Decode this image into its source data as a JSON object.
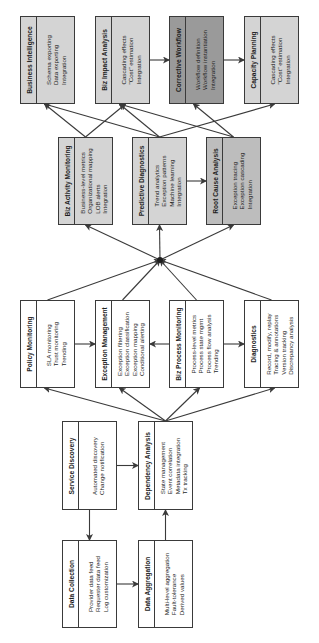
{
  "diagram": {
    "orientation": "rotated-90-ccw",
    "colors": {
      "line": "#3a3a3a",
      "box_light": "#d4d4d4",
      "box_mid": "#bdbdbd",
      "box_dark": "#9a9a9a",
      "box_white": "#ffffff"
    },
    "boxes": {
      "business_intelligence": {
        "title": "Business Intelligence",
        "items": [
          "Schema exporting",
          "Data exporting",
          "Integration"
        ]
      },
      "biz_impact_analysis": {
        "title": "Biz Impact Analysis",
        "items": [
          "Cascading effects",
          "\"Cost\" estimation",
          "Integration"
        ]
      },
      "corrective_workflow": {
        "title": "Corrective Workflow",
        "items": [
          "Workflow definition",
          "Workflow instantiation",
          "Integration"
        ]
      },
      "capacity_planning": {
        "title": "Capacity Planning",
        "items": [
          "Cascading effects",
          "\"Cost\" estimation",
          "Integration"
        ]
      },
      "biz_activity_monitoring": {
        "title": "Biz Activity Monitoring",
        "items": [
          "Business-level metrics",
          "Organizational mapping",
          "LOB alerts",
          "Integration"
        ]
      },
      "predictive_diagnostics": {
        "title": "Predictive Diagnostics",
        "items": [
          "Trend analytics",
          "Exception patterns",
          "Machine learning",
          "Integration"
        ]
      },
      "root_cause_analysis": {
        "title": "Root Cause Analysis",
        "items": [
          "Exception tracing",
          "Exception cascading",
          "Integration"
        ]
      },
      "policy_monitoring": {
        "title": "Policy Monitoring",
        "items": [
          "SLA monitoring",
          "Trust monitoring",
          "Trending"
        ]
      },
      "exception_management": {
        "title": "Exception Management",
        "items": [
          "Exception filtering",
          "Exception classification",
          "Exception mapping",
          "Conditional alerting"
        ]
      },
      "biz_process_monitoring": {
        "title": "Biz Process Monitoring",
        "items": [
          "Process-level metrics",
          "Process state mgmt",
          "Process flow analysis",
          "Trending"
        ]
      },
      "diagnostics": {
        "title": "Diagnostics",
        "items": [
          "Record, modify, replay",
          "Tracing & annotations",
          "Version tracking",
          "Discrepancy analysis"
        ]
      },
      "service_discovery": {
        "title": "Service Discovery",
        "items": [
          "Automated discovery",
          "Change notification"
        ]
      },
      "dependency_analysis": {
        "title": "Dependency Analysis",
        "items": [
          "State management",
          "Event correlation",
          "Metadata integration",
          "Tx tracking"
        ]
      },
      "data_collection": {
        "title": "Data Collection",
        "items": [
          "Provider data feed",
          "Requester data feed",
          "Log customization"
        ]
      },
      "data_aggregation": {
        "title": "Data Aggregation",
        "items": [
          "Multi-level aggregation",
          "Fault-tolerance",
          "Derived values"
        ]
      }
    },
    "edges": [
      [
        "service_discovery",
        "data_collection"
      ],
      [
        "service_discovery",
        "dependency_analysis"
      ],
      [
        "data_collection",
        "data_aggregation"
      ],
      [
        "data_aggregation",
        "dependency_analysis"
      ],
      [
        "dependency_analysis",
        "policy_monitoring"
      ],
      [
        "dependency_analysis",
        "exception_management"
      ],
      [
        "dependency_analysis",
        "biz_process_monitoring"
      ],
      [
        "dependency_analysis",
        "diagnostics"
      ],
      [
        "policy_monitoring",
        "exception_management"
      ],
      [
        "biz_process_monitoring",
        "exception_management"
      ],
      [
        "biz_process_monitoring",
        "diagnostics"
      ],
      [
        "policy_monitoring",
        "hub"
      ],
      [
        "exception_management",
        "hub"
      ],
      [
        "biz_process_monitoring",
        "hub"
      ],
      [
        "diagnostics",
        "hub"
      ],
      [
        "hub",
        "biz_activity_monitoring"
      ],
      [
        "hub",
        "predictive_diagnostics"
      ],
      [
        "hub",
        "root_cause_analysis"
      ],
      [
        "predictive_diagnostics",
        "root_cause_analysis"
      ],
      [
        "biz_activity_monitoring",
        "business_intelligence"
      ],
      [
        "biz_activity_monitoring",
        "biz_impact_analysis"
      ],
      [
        "predictive_diagnostics",
        "business_intelligence"
      ],
      [
        "predictive_diagnostics",
        "biz_impact_analysis"
      ],
      [
        "predictive_diagnostics",
        "capacity_planning"
      ],
      [
        "root_cause_analysis",
        "biz_impact_analysis"
      ],
      [
        "root_cause_analysis",
        "corrective_workflow"
      ],
      [
        "biz_impact_analysis",
        "corrective_workflow"
      ],
      [
        "corrective_workflow",
        "capacity_planning"
      ]
    ]
  }
}
